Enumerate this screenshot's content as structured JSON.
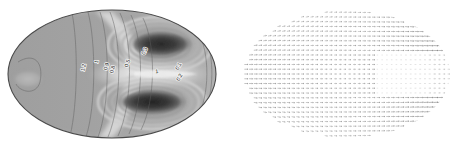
{
  "figure": {
    "title": "",
    "background_color": "#ffffff",
    "panel_count": 2,
    "domain_shape": "ellipse"
  },
  "panels": [
    {
      "name": "contour-panel",
      "kind": "filled-contour",
      "position": "left",
      "colormap": "grayscale",
      "domain": {
        "shape": "ellipse",
        "cx": 112,
        "cy": 74,
        "rx": 104,
        "ry": 64
      },
      "edge_color": "#4a4a4a",
      "labels": [
        {
          "text": "1.2",
          "x": 85,
          "y": 68,
          "rotation": -78
        },
        {
          "text": "1",
          "x": 98,
          "y": 62,
          "rotation": -76
        },
        {
          "text": "0.9",
          "x": 108,
          "y": 67,
          "rotation": -74
        },
        {
          "text": "0.8",
          "x": 114,
          "y": 70,
          "rotation": -72
        },
        {
          "text": "0.5",
          "x": 129,
          "y": 64,
          "rotation": -70
        },
        {
          "text": "0.3",
          "x": 146,
          "y": 52,
          "rotation": -64
        },
        {
          "text": "1",
          "x": 157,
          "y": 73,
          "rotation": -6
        },
        {
          "text": "0.1",
          "x": 180,
          "y": 67,
          "rotation": -62
        },
        {
          "text": "0.2",
          "x": 181,
          "y": 78,
          "rotation": -62
        }
      ],
      "features": [
        {
          "name": "upper-dark-lobe",
          "cx": 160,
          "cy": 44
        },
        {
          "name": "lower-dark-lobe",
          "cx": 152,
          "cy": 102
        },
        {
          "name": "left-light-blob",
          "cx": 27,
          "cy": 79
        },
        {
          "name": "left-uniform-region",
          "cx": 62,
          "cy": 74
        }
      ]
    },
    {
      "name": "quiver-panel",
      "kind": "vector-field",
      "position": "right",
      "arrow_color": "#555555",
      "domain": {
        "shape": "ellipse",
        "cx": 115,
        "cy": 74,
        "rx": 104,
        "ry": 64
      },
      "rows": 27,
      "cols": 44,
      "description": "arrow/quiver field on elliptical domain"
    }
  ]
}
